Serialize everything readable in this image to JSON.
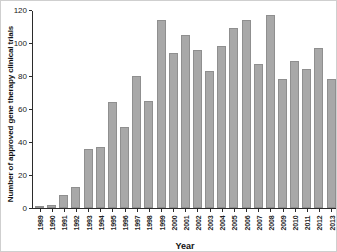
{
  "figure": {
    "ylabel": "Number of approved gene therapy clinical trials",
    "xlabel": "Year"
  },
  "chart_data": {
    "type": "bar",
    "title": "",
    "xlabel": "Year",
    "ylabel": "Number of approved gene therapy clinical trials",
    "categories": [
      "1989",
      "1990",
      "1991",
      "1992",
      "1993",
      "1994",
      "1995",
      "1996",
      "1997",
      "1998",
      "1999",
      "2000",
      "2001",
      "2002",
      "2003",
      "2004",
      "2005",
      "2006",
      "2007",
      "2008",
      "2009",
      "2010",
      "2011",
      "2012",
      "2013"
    ],
    "values": [
      1,
      2,
      8,
      13,
      36,
      37,
      64,
      49,
      80,
      65,
      114,
      94,
      105,
      96,
      83,
      98,
      109,
      114,
      87,
      117,
      78,
      89,
      84,
      97,
      78
    ],
    "ylim": [
      0,
      120
    ],
    "yticks": [
      0,
      20,
      40,
      60,
      80,
      100,
      120
    ],
    "grid": false,
    "legend": "none",
    "bar_color": "#a8a8a8",
    "bar_border_color": "#8f8f8f",
    "axis_color": "#2b2b2b"
  }
}
